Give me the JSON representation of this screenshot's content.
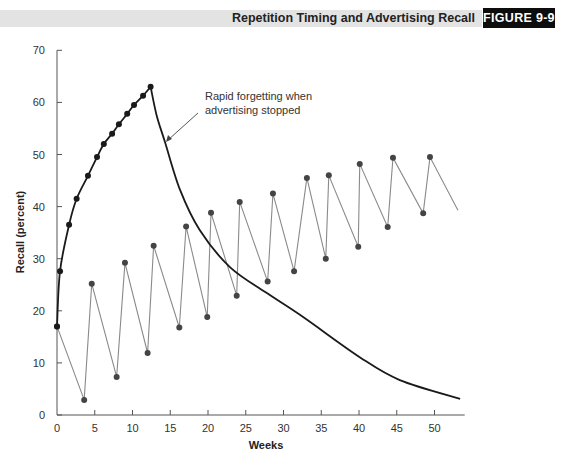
{
  "header": {
    "title": "Repetition Timing and Advertising Recall",
    "figure_label": "FIGURE 9-9"
  },
  "colors": {
    "header_band": "#e3e3e3",
    "badge_bg": "#0d0d0d",
    "concentrated_series": "#1a1a1a",
    "spaced_series": "#8a8a8a",
    "spaced_markers": "#444444"
  },
  "chart_data": {
    "type": "line",
    "title": "Repetition Timing and Advertising Recall",
    "xlabel": "Weeks",
    "ylabel": "Recall (percent)",
    "xlim": [
      0,
      54
    ],
    "ylim": [
      0,
      70
    ],
    "xticks": [
      0,
      5,
      10,
      15,
      20,
      25,
      30,
      35,
      40,
      45,
      50
    ],
    "yticks": [
      0,
      10,
      20,
      30,
      40,
      50,
      60,
      70
    ],
    "grid": false,
    "legend": null,
    "annotations": [
      {
        "text_line1": "Rapid forgetting when",
        "text_line2": "advertising stopped",
        "arrow_to": {
          "x": 14.3,
          "y": 52.4
        }
      }
    ],
    "series": [
      {
        "name": "Concentrated weekly advertising (13 weeks)",
        "style": "thick-black-with-markers",
        "points": [
          {
            "x": 0.0,
            "y": 17.0
          },
          {
            "x": 0.4,
            "y": 27.6
          },
          {
            "x": 1.6,
            "y": 36.5
          },
          {
            "x": 2.6,
            "y": 41.5
          },
          {
            "x": 4.1,
            "y": 45.9
          },
          {
            "x": 5.3,
            "y": 49.5
          },
          {
            "x": 6.2,
            "y": 52.0
          },
          {
            "x": 7.3,
            "y": 54.0
          },
          {
            "x": 8.2,
            "y": 55.8
          },
          {
            "x": 9.3,
            "y": 57.8
          },
          {
            "x": 10.2,
            "y": 59.5
          },
          {
            "x": 11.4,
            "y": 61.3
          },
          {
            "x": 12.4,
            "y": 63.0
          }
        ]
      },
      {
        "name": "Forgetting after advertising stopped",
        "style": "thick-black-line",
        "points": [
          {
            "x": 12.4,
            "y": 63.0
          },
          {
            "x": 13.2,
            "y": 57.5
          },
          {
            "x": 14.3,
            "y": 52.4
          },
          {
            "x": 16.3,
            "y": 43.2
          },
          {
            "x": 18.9,
            "y": 35.5
          },
          {
            "x": 22.9,
            "y": 28.4
          },
          {
            "x": 27.8,
            "y": 23.4
          },
          {
            "x": 32.6,
            "y": 18.8
          },
          {
            "x": 40.1,
            "y": 11.1
          },
          {
            "x": 45.4,
            "y": 6.7
          },
          {
            "x": 53.4,
            "y": 3.1
          }
        ]
      },
      {
        "name": "Spaced advertising (every 4 weeks)",
        "style": "thin-gray-sawtooth-with-markers",
        "points": [
          {
            "x": 0.0,
            "y": 17.0
          },
          {
            "x": 3.6,
            "y": 2.9
          },
          {
            "x": 4.6,
            "y": 25.2
          },
          {
            "x": 7.9,
            "y": 7.3
          },
          {
            "x": 9.0,
            "y": 29.2
          },
          {
            "x": 12.0,
            "y": 11.9
          },
          {
            "x": 12.8,
            "y": 32.5
          },
          {
            "x": 16.2,
            "y": 16.8
          },
          {
            "x": 17.1,
            "y": 36.2
          },
          {
            "x": 19.9,
            "y": 18.8
          },
          {
            "x": 20.4,
            "y": 38.8
          },
          {
            "x": 23.8,
            "y": 22.9
          },
          {
            "x": 24.2,
            "y": 40.9
          },
          {
            "x": 27.9,
            "y": 25.6
          },
          {
            "x": 28.6,
            "y": 42.5
          },
          {
            "x": 31.4,
            "y": 27.6
          },
          {
            "x": 33.1,
            "y": 45.5
          },
          {
            "x": 35.6,
            "y": 30.0
          },
          {
            "x": 36.0,
            "y": 46.0
          },
          {
            "x": 39.9,
            "y": 32.3
          },
          {
            "x": 40.1,
            "y": 48.2
          },
          {
            "x": 43.8,
            "y": 36.1
          },
          {
            "x": 44.5,
            "y": 49.4
          },
          {
            "x": 48.5,
            "y": 38.7
          },
          {
            "x": 49.4,
            "y": 49.5
          },
          {
            "x": 53.1,
            "y": 39.3,
            "marker": false
          }
        ]
      }
    ]
  }
}
